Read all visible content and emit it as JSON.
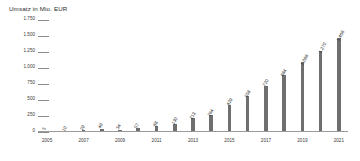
{
  "chart_data": {
    "type": "bar",
    "title": "Umsatz in Mio. EUR",
    "xlabel": "",
    "ylabel": "",
    "ylim": [
      0,
      1750
    ],
    "grid": true,
    "legend": false,
    "categories": [
      "2005",
      "2006",
      "2007",
      "2008",
      "2009",
      "2010",
      "2011",
      "2012",
      "2013",
      "2014",
      "2015",
      "2016",
      "2017",
      "2018",
      "2019",
      "2020",
      "2021"
    ],
    "values": [
      5,
      10,
      29,
      49,
      34,
      57,
      88,
      130,
      213,
      264,
      429,
      558,
      720,
      884,
      1088,
      1270,
      1468
    ],
    "value_labels": [
      "5",
      "10",
      "29",
      "49",
      "34",
      "57",
      "88",
      "130",
      "213",
      "264",
      "429",
      "558",
      "720",
      "884",
      "1.088",
      "1.270",
      "1.468"
    ],
    "ytick_values": [
      0,
      250,
      500,
      750,
      1000,
      1250,
      1500,
      1750
    ],
    "ytick_labels": [
      "0",
      "250",
      "500",
      "750",
      "1.000",
      "1.250",
      "1.500",
      "1.750"
    ],
    "xtick_labels": [
      "2005",
      "2007",
      "2009",
      "2011",
      "2013",
      "2015",
      "2017",
      "2019",
      "2021"
    ],
    "xtick_indices": [
      0,
      2,
      4,
      6,
      8,
      10,
      12,
      14,
      16
    ],
    "bar_color": "#6f6f6f",
    "axis_color": "#9a9a9a",
    "text_color": "#2b2b2b",
    "background_color": "#ffffff"
  }
}
